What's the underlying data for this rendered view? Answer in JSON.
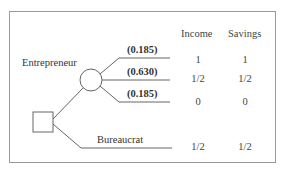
{
  "diagram": {
    "type": "decision-tree",
    "columns": [
      "Income",
      "Savings"
    ],
    "choices": [
      {
        "label": "Entrepreneur",
        "outcomes": [
          {
            "probability": "(0.185)",
            "income": "1",
            "savings": "1"
          },
          {
            "probability": "(0.630)",
            "income": "1/2",
            "savings": "1/2"
          },
          {
            "probability": "(0.185)",
            "income": "0",
            "savings": "0"
          }
        ]
      },
      {
        "label": "Bureaucrat",
        "income": "1/2",
        "savings": "1/2"
      }
    ]
  }
}
